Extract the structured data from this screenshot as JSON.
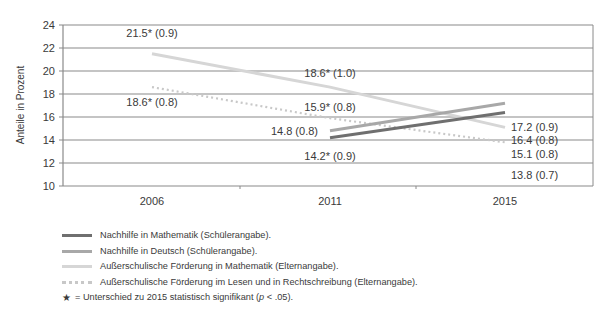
{
  "chart_data": {
    "type": "line",
    "title": "",
    "xlabel": "",
    "ylabel": "Anteile in Prozent",
    "ylim": [
      10,
      24
    ],
    "yticks": [
      10,
      12,
      14,
      16,
      18,
      20,
      22,
      24
    ],
    "categories": [
      "2006",
      "2011",
      "2015"
    ],
    "grid": true,
    "legend_position": "bottom",
    "series": [
      {
        "name": "Nachhilfe in Mathematik (Schülerangabe).",
        "color": "#6f6f6f",
        "style": "solid",
        "width": 3,
        "values": [
          null,
          14.2,
          16.4
        ],
        "labels": [
          null,
          "14.2* (0.9)",
          "16.4 (0.8)"
        ]
      },
      {
        "name": "Nachhilfe in Deutsch (Schülerangabe).",
        "color": "#a8a8a8",
        "style": "solid",
        "width": 3,
        "values": [
          null,
          14.8,
          17.2
        ],
        "labels": [
          null,
          "14.8 (0.8)",
          "17.2 (0.9)"
        ]
      },
      {
        "name": "Außerschulische Förderung in Mathematik (Elternangabe).",
        "color": "#d6d6d6",
        "style": "solid",
        "width": 3,
        "values": [
          21.5,
          18.6,
          15.1
        ],
        "labels": [
          "21.5* (0.9)",
          "18.6* (1.0)",
          "15.1 (0.8)"
        ]
      },
      {
        "name": "Außerschulische Förderung im Lesen und in Rechtschreibung (Elternangabe).",
        "color": "#c8c8c8",
        "style": "dotted",
        "width": 3,
        "values": [
          18.6,
          15.9,
          13.8
        ],
        "labels": [
          "18.6* (0.8)",
          "15.9* (0.8)",
          "13.8 (0.7)"
        ]
      }
    ],
    "annotations": [
      "★ = Unterschied zu 2015 statistisch signifikant (p < .05)."
    ]
  },
  "legend": {
    "items": [
      {
        "label": "Nachhilfe in Mathematik (Schülerangabe)."
      },
      {
        "label": "Nachhilfe in Deutsch (Schülerangabe)."
      },
      {
        "label": "Außerschulische Förderung in Mathematik (Elternangabe)."
      },
      {
        "label": "Außerschulische Förderung im Lesen und in Rechtschreibung (Elternangabe)."
      }
    ],
    "note": {
      "star": "★",
      "text_before": "= Unterschied zu 2015 statistisch signifikant (",
      "p": "p",
      "text_after": " < .05)."
    }
  }
}
